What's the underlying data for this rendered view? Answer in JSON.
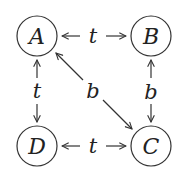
{
  "diagram": {
    "type": "graph",
    "nodes": [
      {
        "id": "A",
        "label": "A",
        "cx": 37,
        "cy": 36
      },
      {
        "id": "B",
        "label": "B",
        "cx": 151,
        "cy": 36
      },
      {
        "id": "C",
        "label": "C",
        "cx": 151,
        "cy": 146
      },
      {
        "id": "D",
        "label": "D",
        "cx": 37,
        "cy": 146
      }
    ],
    "edges": [
      {
        "from": "A",
        "to": "B",
        "label": "t",
        "direction": "both"
      },
      {
        "from": "A",
        "to": "D",
        "label": "t",
        "direction": "both"
      },
      {
        "from": "D",
        "to": "C",
        "label": "t",
        "direction": "both"
      },
      {
        "from": "B",
        "to": "C",
        "label": "b",
        "direction": "both"
      },
      {
        "from": "A",
        "to": "C",
        "label": "b",
        "direction": "both"
      }
    ],
    "colors": {
      "stroke": "#333333",
      "text": "#222222",
      "background": "#ffffff"
    }
  }
}
